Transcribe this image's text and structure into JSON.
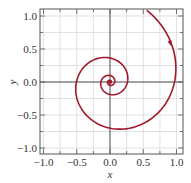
{
  "chart_data": {
    "type": "line",
    "title": "",
    "xlabel": "x",
    "ylabel": "y",
    "xlim": [
      -1.1,
      1.05
    ],
    "ylim": [
      -1.1,
      1.1
    ],
    "xticks": [
      -1.0,
      -0.5,
      0.0,
      0.5,
      1.0
    ],
    "yticks": [
      -1.0,
      -0.5,
      0.0,
      0.5,
      1.0
    ],
    "xtick_labels": [
      "−1.0",
      "−0.5",
      "0.0",
      "0.5",
      "1.0"
    ],
    "ytick_labels": [
      "−1.0",
      "−0.5",
      "0.0",
      "0.5",
      "1.0"
    ],
    "grid": true,
    "grid_step": 0.25,
    "legend": null,
    "series": [
      {
        "name": "phase trajectory (clockwise spiral into origin)",
        "color": "#a3182a",
        "model": {
          "form": "logarithmic spiral r = r0*exp(-k*theta), theta clockwise from +x",
          "r0": 0.97,
          "k": 0.208,
          "theta_start": -1.1,
          "theta_end": 19.0
        },
        "key_points": [
          {
            "x": 0.55,
            "y": 1.09
          },
          {
            "x": 0.93,
            "y": 0.57
          },
          {
            "x": 0.97,
            "y": 0.0
          },
          {
            "x": 0.0,
            "y": -0.7
          },
          {
            "x": -0.5,
            "y": 0.0
          },
          {
            "x": 0.0,
            "y": 0.36
          },
          {
            "x": 0.26,
            "y": 0.0
          },
          {
            "x": 0.0,
            "y": -0.19
          },
          {
            "x": -0.14,
            "y": 0.0
          },
          {
            "x": 0.0,
            "y": 0.1
          },
          {
            "x": 0.07,
            "y": 0.0
          },
          {
            "x": 0.0,
            "y": 0.0
          }
        ],
        "arrow": {
          "x": 0.91,
          "y": 0.58,
          "direction": "clockwise / inward"
        }
      }
    ],
    "annotations": [
      {
        "type": "point",
        "x": 0.0,
        "y": 0.0,
        "label": ""
      }
    ]
  },
  "colors": {
    "curve": "#a3182a",
    "axis": "#444444",
    "grid": "#d9d9d9",
    "frame": "#555555"
  }
}
